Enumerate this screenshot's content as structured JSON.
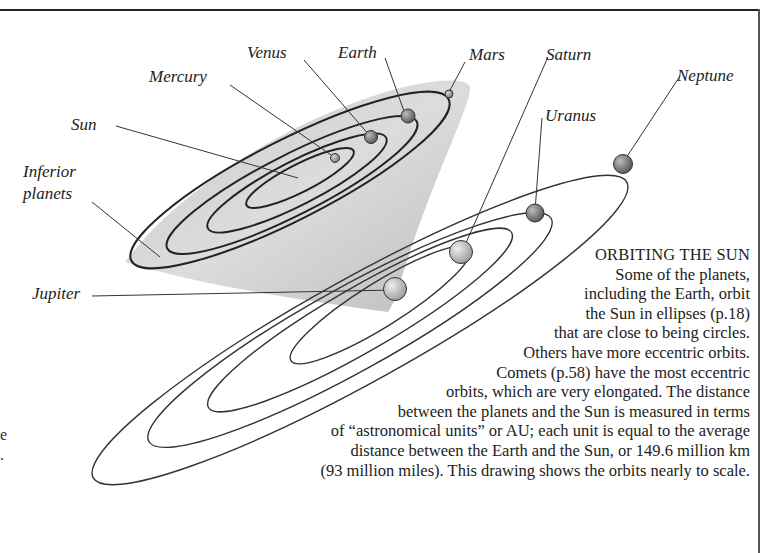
{
  "labels": {
    "mercury": "Mercury",
    "venus": "Venus",
    "earth": "Earth",
    "mars": "Mars",
    "saturn": "Saturn",
    "neptune": "Neptune",
    "uranus": "Uranus",
    "sun": "Sun",
    "inferior_line1": "Inferior",
    "inferior_line2": "planets",
    "jupiter": "Jupiter"
  },
  "caption": {
    "title": "ORBITING THE SUN",
    "lines": [
      "Some of the planets,",
      "including the Earth, orbit",
      "the Sun in ellipses (p.18)",
      "that are close to being circles.",
      "Others have more eccentric orbits.",
      "Comets (p.58) have the most eccentric",
      "orbits, which are very elongated. The distance",
      "between the planets and the Sun is measured in terms",
      "of “astronomical units” or AU; each unit is equal to the average",
      "distance between the Earth and the Sun, or 149.6 million km",
      "(93 million miles). This drawing shows the orbits nearly to scale."
    ]
  },
  "left_fragments": {
    "frag1": "e",
    "frag2": "."
  }
}
